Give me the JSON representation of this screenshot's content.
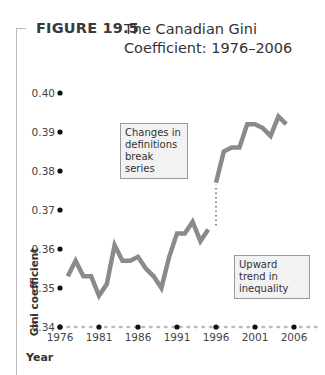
{
  "figure": {
    "label": "FIGURE 19.5",
    "title": "The Canadian Gini Coefficient: 1976–2006"
  },
  "annotations": {
    "break": "Changes in definitions break series",
    "trend": "Upward trend in inequality"
  },
  "axes": {
    "ylabel": "Gini coefficient",
    "xlabel": "Year"
  },
  "colors": {
    "line": "#8a8a8a",
    "axis_dots": "#bbbbbb",
    "tick_dots": "#111111",
    "annotation_bg": "#f2f2f2"
  },
  "chart_data": {
    "type": "line",
    "title": "The Canadian Gini Coefficient: 1976–2006",
    "xlabel": "Year",
    "ylabel": "Gini coefficient",
    "xlim": [
      1976,
      2006
    ],
    "ylim": [
      0.34,
      0.4
    ],
    "x_ticks": [
      "1976",
      "1981",
      "1986",
      "1991",
      "1996",
      "2001",
      "2006"
    ],
    "y_ticks": [
      "0.34",
      "0.35",
      "0.36",
      "0.37",
      "0.38",
      "0.39",
      "0.40"
    ],
    "grid": false,
    "series": [
      {
        "name": "Gini coefficient (old definition)",
        "x": [
          1977,
          1978,
          1979,
          1980,
          1981,
          1982,
          1983,
          1984,
          1985,
          1986,
          1987,
          1988,
          1989,
          1990,
          1991,
          1992,
          1993,
          1994,
          1995
        ],
        "values": [
          0.353,
          0.357,
          0.353,
          0.353,
          0.348,
          0.351,
          0.361,
          0.357,
          0.357,
          0.358,
          0.355,
          0.353,
          0.35,
          0.358,
          0.364,
          0.364,
          0.367,
          0.362,
          0.365
        ]
      },
      {
        "name": "Gini coefficient (new definition)",
        "x": [
          1996,
          1997,
          1998,
          1999,
          2000,
          2001,
          2002,
          2003,
          2004,
          2005
        ],
        "values": [
          0.377,
          0.385,
          0.386,
          0.386,
          0.392,
          0.392,
          0.391,
          0.389,
          0.394,
          0.392
        ]
      }
    ],
    "annotations": [
      "Changes in definitions break series",
      "Upward trend in inequality"
    ]
  }
}
